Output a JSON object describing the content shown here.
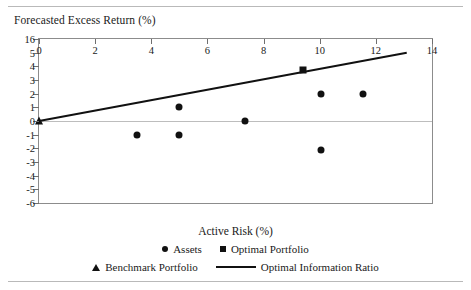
{
  "chart_data": {
    "type": "scatter",
    "title": "",
    "ylabel": "Forecasted Excess Return (%)",
    "xlabel": "Active Risk (%)",
    "xlim": [
      0,
      14
    ],
    "ylim": [
      -6,
      6
    ],
    "grid": false,
    "xticks": [
      "0",
      "2",
      "4",
      "6",
      "8",
      "10",
      "12",
      "14"
    ],
    "yticks": [
      "16",
      "5",
      "4",
      "3",
      "2",
      "1",
      "0",
      "-1",
      "-2",
      "-3",
      "-4",
      "-5",
      "-6"
    ],
    "ytick_values": [
      6,
      5,
      4,
      3,
      2,
      1,
      0,
      -1,
      -2,
      -3,
      -4,
      -5,
      -6
    ],
    "xtick_values": [
      0,
      2,
      4,
      6,
      8,
      10,
      12,
      14
    ],
    "legend_position": "below-axis",
    "series": [
      {
        "name": "Assets",
        "marker": "circle",
        "points": [
          {
            "x": 3.5,
            "y": -1.0
          },
          {
            "x": 5.0,
            "y": 1.0
          },
          {
            "x": 5.0,
            "y": -1.0
          },
          {
            "x": 7.35,
            "y": 0.0
          },
          {
            "x": 10.05,
            "y": 2.0
          },
          {
            "x": 10.05,
            "y": -2.1
          },
          {
            "x": 11.55,
            "y": 2.0
          }
        ]
      },
      {
        "name": "Optimal Portfolio",
        "marker": "square",
        "points": [
          {
            "x": 9.4,
            "y": 3.7
          }
        ]
      },
      {
        "name": "Benchmark Portfolio",
        "marker": "triangle",
        "points": [
          {
            "x": 0.0,
            "y": 0.0
          }
        ]
      },
      {
        "name": "Optimal Information Ratio",
        "marker": "line",
        "points": [
          {
            "x": 0.0,
            "y": 0.0
          },
          {
            "x": 13.1,
            "y": 5.0
          }
        ]
      }
    ]
  },
  "legend": {
    "row1": [
      {
        "label": "Assets",
        "swatch": "circle"
      },
      {
        "label": "Optimal Portfolio",
        "swatch": "square"
      }
    ],
    "row2": [
      {
        "label": "Benchmark Portfolio",
        "swatch": "triangle"
      },
      {
        "label": "Optimal Information Ratio",
        "swatch": "line"
      }
    ]
  },
  "colors": {
    "marker": "#111111",
    "line": "#111111",
    "frame": "#8c8c8c",
    "zero_line": "#bdbdbd",
    "rule": "#b9b9b9"
  }
}
